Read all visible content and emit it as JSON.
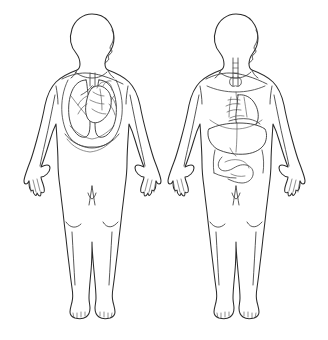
{
  "document": {
    "title": "Human Body Anatomy Diagram",
    "background_color": "#ffffff",
    "line_color": "#2b2b2b",
    "organ_line_color": "#333333",
    "width": 328,
    "height": 340,
    "style": "black-and-white line drawing, no labels or text visible"
  },
  "figures": [
    {
      "id": "figure-left",
      "name": "respiratory-cardiac-figure",
      "position": "left",
      "pose": "standing frontal body with head in right-facing profile, arms at sides",
      "center_x": 92,
      "system_shown": "respiratory and cardiovascular",
      "organs": [
        {
          "name": "right-lung",
          "label": "Right lung"
        },
        {
          "name": "left-lung",
          "label": "Left lung"
        },
        {
          "name": "heart",
          "label": "Heart"
        },
        {
          "name": "trachea",
          "label": "Trachea"
        },
        {
          "name": "bronchi",
          "label": "Bronchi"
        },
        {
          "name": "diaphragm",
          "label": "Diaphragm"
        }
      ]
    },
    {
      "id": "figure-right",
      "name": "digestive-figure",
      "position": "right",
      "pose": "standing frontal body with head in right-facing profile, arms at sides",
      "center_x": 236,
      "system_shown": "digestive",
      "organs": [
        {
          "name": "esophagus",
          "label": "Esophagus"
        },
        {
          "name": "liver",
          "label": "Liver"
        },
        {
          "name": "stomach",
          "label": "Stomach"
        },
        {
          "name": "small-intestine",
          "label": "Small intestine"
        },
        {
          "name": "large-intestine",
          "label": "Large intestine"
        },
        {
          "name": "pancreas",
          "label": "Pancreas"
        }
      ]
    }
  ],
  "anatomy_landmarks": [
    "head-profile",
    "neck",
    "clavicle",
    "shoulder",
    "arm",
    "hand",
    "torso",
    "hip",
    "knee",
    "lower-leg",
    "ankle",
    "foot"
  ]
}
